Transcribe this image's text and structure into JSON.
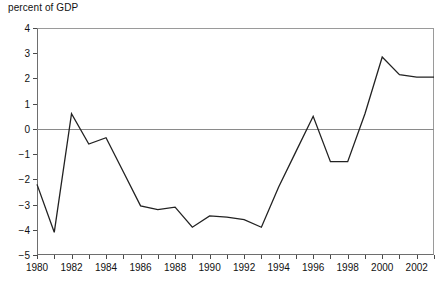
{
  "chart_data": {
    "type": "line",
    "title": "percent of GDP",
    "xlabel": "",
    "ylabel": "",
    "ylim": [
      -5,
      4
    ],
    "xlim": [
      1980,
      2003
    ],
    "grid": false,
    "legend": null,
    "zero_line": true,
    "ytick_labels": [
      "4",
      "3",
      "2",
      "1",
      "0",
      "-1",
      "-2",
      "-3",
      "-4",
      "-5"
    ],
    "ytick_values": [
      4,
      3,
      2,
      1,
      0,
      -1,
      -2,
      -3,
      -4,
      -5
    ],
    "xtick_values": [
      1980,
      1981,
      1982,
      1983,
      1984,
      1985,
      1986,
      1987,
      1988,
      1989,
      1990,
      1991,
      1992,
      1993,
      1994,
      1995,
      1996,
      1997,
      1998,
      1999,
      2000,
      2001,
      2002,
      2003
    ],
    "xtick_labels": [
      "1980",
      "",
      "1982",
      "",
      "1984",
      "",
      "1986",
      "",
      "1988",
      "",
      "1990",
      "",
      "1992",
      "",
      "1994",
      "",
      "1996",
      "",
      "1998",
      "",
      "2000",
      "",
      "2002",
      ""
    ],
    "x": [
      1980,
      1981,
      1982,
      1983,
      1984,
      1985,
      1986,
      1987,
      1988,
      1989,
      1990,
      1991,
      1992,
      1993,
      1994,
      1995,
      1996,
      1997,
      1998,
      1999,
      2000,
      2001,
      2002,
      2003
    ],
    "values": [
      -2.2,
      -4.1,
      0.6,
      -0.6,
      -0.35,
      -1.7,
      -3.05,
      -3.2,
      -3.1,
      -3.9,
      -3.45,
      -3.5,
      -3.6,
      -3.9,
      -2.3,
      -0.9,
      0.5,
      -1.3,
      -1.3,
      0.6,
      2.85,
      2.15,
      2.05,
      2.05
    ],
    "line_color": "#222222",
    "axis_color": "#6e6e6e",
    "zero_line_color": "#8a8a8a"
  }
}
